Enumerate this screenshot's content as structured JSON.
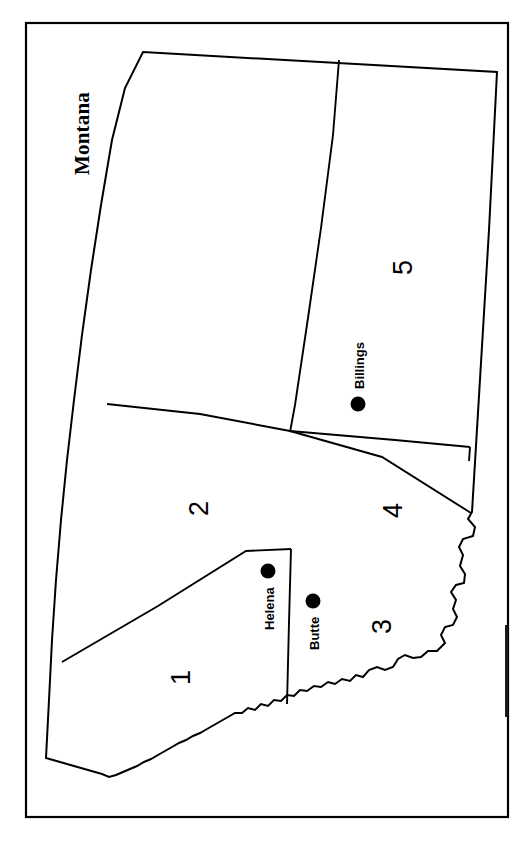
{
  "figure": {
    "title": "Montana",
    "orientation": "rotated-90-ccw",
    "background_color": "#ffffff",
    "line_color": "#000000",
    "frame": {
      "x": 26,
      "y": 23,
      "width": 482,
      "height": 794
    }
  },
  "regions": [
    {
      "id": "region-1",
      "label": "1",
      "x": 168,
      "y": 685
    },
    {
      "id": "region-2",
      "label": "2",
      "x": 186,
      "y": 516
    },
    {
      "id": "region-3",
      "label": "3",
      "x": 369,
      "y": 634
    },
    {
      "id": "region-4",
      "label": "4",
      "x": 380,
      "y": 518
    },
    {
      "id": "region-5",
      "label": "5",
      "x": 390,
      "y": 275
    }
  ],
  "cities": [
    {
      "id": "city-helena",
      "label": "Helena",
      "dot_x": 268,
      "dot_y": 571,
      "label_x": 262,
      "label_y": 630
    },
    {
      "id": "city-butte",
      "label": "Butte",
      "dot_x": 313,
      "dot_y": 601,
      "label_x": 307,
      "label_y": 650
    },
    {
      "id": "city-billings",
      "label": "Billings",
      "dot_x": 358,
      "dot_y": 404,
      "label_x": 352,
      "label_y": 389
    }
  ],
  "geometry": {
    "state_outline": "M 143,52 L 497,72 L 489,229 L 470,515 L 468,520 L 474,528 L 472,537 L 462,540 L 458,548 L 462,556 L 459,567 L 464,575 L 463,584 L 455,585 L 450,592 L 455,600 L 452,609 L 456,617 L 452,625 L 444,626 L 440,634 L 444,642 L 436,650 L 427,650 L 420,656 L 412,657 L 404,654 L 396,657 L 392,665 L 384,668 L 376,665 L 368,668 L 362,675 L 354,674 L 346,677 L 338,674 L 330,676 L 322,674 L 314,677 L 306,675 L 298,678 L 290,676 L 282,679 L 276,686 L 268,684 L 262,690 L 254,688 L 248,694 L 240,696 L 232,699 L 224,703 L 216,708 L 208,713 L 200,718 L 192,722 L 184,727 L 176,731 L 168,736 L 160,740 L 152,744 L 144,748 L 136,752 L 128,756 L 120,760 L 112,764 L 104,768 L 96,772 L 88,776 L 80,780 L 72,784 L 64,788 L 56,787 L 50,778 L 46,740 L 44,700 L 43,660 L 48,600 L 58,520 L 68,440 L 80,340 L 92,250 L 105,160 L 120,90 Z",
    "divider_2_5": "M 339,60 L 334,130 L 322,220 L 310,310 L 296,400 L 290,430",
    "divider_north_mid": "M 105,405 L 200,414 L 290,430 L 400,440 L 470,446",
    "divider_3_4": "M 290,430 L 380,455 L 470,515",
    "divider_1_2": "M 64,660 L 160,603 L 248,549 L 290,548",
    "divider_helena_butte": "M 290,548 L 288,620 L 286,700",
    "divider_4_5": "M 470,446 L 468,458"
  }
}
